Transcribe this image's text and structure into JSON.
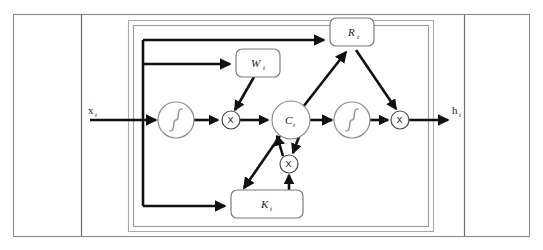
{
  "figure": {
    "background_color": "#ffffff",
    "outer_frame_color": "#8a8a8a",
    "wire_color": "#111111",
    "box_stroke_color": "#7d7d7d"
  },
  "io": {
    "input_label": "x",
    "input_subscript": "t",
    "output_label": "h",
    "output_subscript": "t"
  },
  "gates": [
    {
      "id": "R",
      "name": "gate-box-r",
      "label": "R",
      "subscript": "t",
      "x": 330,
      "y": 18,
      "width": 44,
      "height": 28
    },
    {
      "id": "W",
      "name": "gate-box-w",
      "label": "W",
      "subscript": "t",
      "x": 236,
      "y": 49,
      "width": 44,
      "height": 28
    },
    {
      "id": "K",
      "name": "gate-box-k",
      "label": "K",
      "subscript": "t",
      "x": 231,
      "y": 190,
      "width": 72,
      "height": 28
    }
  ],
  "nodes": [
    {
      "id": "sigma_left",
      "name": "sigmoid-node-left",
      "type": "sigmoid",
      "cx": 176,
      "cy": 120,
      "r": 18,
      "label": ""
    },
    {
      "id": "mul_left",
      "name": "multiply-node-left",
      "type": "multiply",
      "cx": 231,
      "cy": 120,
      "r": 9,
      "label": "X"
    },
    {
      "id": "cell",
      "name": "cell-state-node",
      "type": "state",
      "cx": 291,
      "cy": 120,
      "r": 19,
      "label": "C",
      "subscript": "t"
    },
    {
      "id": "sigma_right",
      "name": "sigmoid-node-right",
      "type": "sigmoid",
      "cx": 352,
      "cy": 120,
      "r": 18,
      "label": ""
    },
    {
      "id": "mul_right",
      "name": "multiply-node-right",
      "type": "multiply",
      "cx": 400,
      "cy": 120,
      "r": 9,
      "label": "X"
    },
    {
      "id": "mul_bottom",
      "name": "multiply-node-bottom",
      "type": "multiply",
      "cx": 289,
      "cy": 164,
      "r": 9,
      "label": "X"
    }
  ],
  "connections": [
    {
      "name": "wire-input-to-sigmoid",
      "from": "x_t",
      "to": "sigma_left"
    },
    {
      "name": "wire-input-bus-vertical",
      "from": "input-bus",
      "to": "branches"
    },
    {
      "name": "wire-bus-to-r",
      "from": "input-bus",
      "to": "R"
    },
    {
      "name": "wire-bus-to-w",
      "from": "input-bus",
      "to": "W"
    },
    {
      "name": "wire-bus-to-k",
      "from": "input-bus",
      "to": "K"
    },
    {
      "name": "wire-sigmoid-to-mul-left",
      "from": "sigma_left",
      "to": "mul_left"
    },
    {
      "name": "wire-w-to-mul-left",
      "from": "W",
      "to": "mul_left"
    },
    {
      "name": "wire-mul-left-to-cell",
      "from": "mul_left",
      "to": "cell"
    },
    {
      "name": "wire-cell-to-r",
      "from": "cell",
      "to": "R"
    },
    {
      "name": "wire-r-to-mul-right",
      "from": "R",
      "to": "mul_right"
    },
    {
      "name": "wire-cell-to-sigmoid-right",
      "from": "cell",
      "to": "sigma_right"
    },
    {
      "name": "wire-sigmoid-right-to-mul-right",
      "from": "sigma_right",
      "to": "mul_right"
    },
    {
      "name": "wire-mul-right-to-output",
      "from": "mul_right",
      "to": "h_t"
    },
    {
      "name": "wire-cell-to-mul-bottom",
      "from": "cell",
      "to": "mul_bottom"
    },
    {
      "name": "wire-mul-bottom-to-cell",
      "from": "mul_bottom",
      "to": "cell"
    },
    {
      "name": "wire-cell-to-k",
      "from": "cell",
      "to": "K"
    },
    {
      "name": "wire-k-to-mul-bottom",
      "from": "K",
      "to": "mul_bottom"
    }
  ]
}
